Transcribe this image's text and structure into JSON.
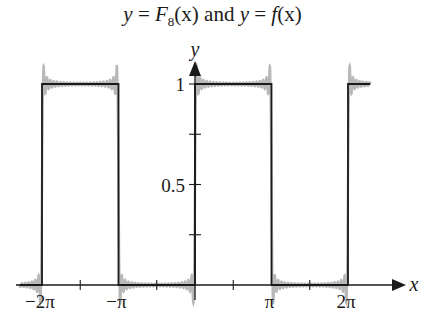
{
  "title": {
    "text": "y = F8(x) and y = f(x)",
    "part1": "y",
    "eq1": " = ",
    "F": "F",
    "sub": "8",
    "arg1": "(x)",
    "and": " and ",
    "part2": "y",
    "eq2": " = ",
    "f": "f",
    "arg2": "(x)"
  },
  "axes": {
    "x_label": "x",
    "y_label": "y",
    "x_ticks": [
      {
        "label": "−2π",
        "value": -6.2832
      },
      {
        "label": "−π",
        "value": -3.1416
      },
      {
        "label": "π",
        "value": 3.1416
      },
      {
        "label": "2π",
        "value": 6.2832
      }
    ],
    "y_ticks": [
      {
        "label": "1",
        "value": 1
      },
      {
        "label": "0.5",
        "value": 0.5
      }
    ]
  },
  "colors": {
    "f_line": "#1a1a1a",
    "fourier_line": "#a0a0a0",
    "axis": "#1a1a1a"
  },
  "chart_data": {
    "type": "line",
    "title": "y = F8(x) and y = f(x)",
    "xlabel": "x",
    "ylabel": "y",
    "xlim": [
      -7.2,
      7.9
    ],
    "ylim": [
      0,
      1.1
    ],
    "grid": false,
    "legend": "none",
    "x_tick_labels": [
      "−2π",
      "−π",
      "π",
      "2π"
    ],
    "y_tick_labels": [
      "0.5",
      "1"
    ],
    "series": [
      {
        "name": "f(x) (square wave)",
        "color": "#1a1a1a",
        "x": [
          -7.2,
          -6.2832,
          -6.2832,
          -3.1416,
          -3.1416,
          0,
          0,
          3.1416,
          3.1416,
          6.2832,
          6.2832,
          7.2
        ],
        "y": [
          0,
          0,
          1,
          1,
          0,
          0,
          1,
          1,
          0,
          0,
          1,
          1
        ]
      },
      {
        "name": "F8(x) (Fourier partial sum, Gibbs overshoot)",
        "color": "#a0a0a0",
        "description": "Closely follows f(x) with small oscillations and ~9% overshoot near each jump at multiples of π",
        "overshoot_max": 1.09,
        "undershoot_min": -0.09
      }
    ]
  }
}
